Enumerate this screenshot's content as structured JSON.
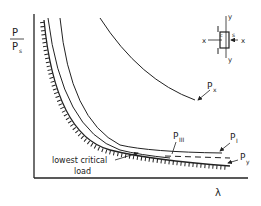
{
  "diagram": {
    "type": "buckling load curves",
    "y_axis": {
      "numerator": "P",
      "denominator": "P",
      "denominator_sub": "s"
    },
    "x_axis": {
      "label": "λ"
    },
    "curves": [
      {
        "id": "Px",
        "label": "P",
        "sub": "x"
      },
      {
        "id": "PI",
        "label": "P",
        "sub": "I"
      },
      {
        "id": "PIII",
        "label": "P",
        "sub": "III"
      },
      {
        "id": "Py",
        "label": "P",
        "sub": "y",
        "style": "dashed"
      }
    ],
    "annotation": {
      "line1": "lowest critical",
      "line2": "load"
    },
    "section": {
      "axis_x_left": "x",
      "axis_x_right": "x",
      "axis_y_top": "y",
      "axis_y_bottom": "y",
      "shear_center": "s",
      "centroid": "c"
    }
  }
}
